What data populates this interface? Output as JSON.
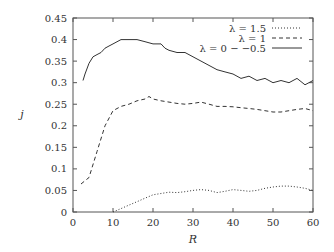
{
  "chart_data": {
    "type": "line",
    "title": "",
    "xlabel": "R",
    "ylabel": "j",
    "xlim": [
      0,
      60
    ],
    "ylim": [
      0,
      0.45
    ],
    "xticks": [
      "0",
      "10",
      "20",
      "30",
      "40",
      "50",
      "60"
    ],
    "yticks": [
      "0",
      "0.05",
      "0.1",
      "0.15",
      "0.2",
      "0.25",
      "0.3",
      "0.35",
      "0.4",
      "0.45"
    ],
    "grid": false,
    "legend_position": "top-right",
    "series": [
      {
        "name": "λ = 1.5",
        "style": "dotted",
        "x": [
          10,
          12,
          14,
          16,
          18,
          20,
          22,
          24,
          26,
          28,
          30,
          32,
          34,
          36,
          38,
          40,
          42,
          44,
          46,
          48,
          50,
          52,
          54,
          56,
          58,
          60
        ],
        "y": [
          0.0,
          0.008,
          0.016,
          0.024,
          0.032,
          0.04,
          0.043,
          0.046,
          0.045,
          0.047,
          0.05,
          0.052,
          0.05,
          0.045,
          0.048,
          0.052,
          0.05,
          0.048,
          0.05,
          0.055,
          0.058,
          0.06,
          0.06,
          0.058,
          0.055,
          0.05
        ]
      },
      {
        "name": "λ = 1",
        "style": "dashed",
        "x": [
          2,
          4,
          6,
          8,
          10,
          12,
          14,
          16,
          18,
          19,
          20,
          22,
          24,
          26,
          28,
          30,
          32,
          34,
          36,
          38,
          40,
          42,
          44,
          46,
          48,
          50,
          52,
          54,
          56,
          58,
          60
        ],
        "y": [
          0.065,
          0.08,
          0.14,
          0.2,
          0.235,
          0.245,
          0.25,
          0.258,
          0.262,
          0.268,
          0.262,
          0.258,
          0.255,
          0.252,
          0.25,
          0.252,
          0.255,
          0.25,
          0.245,
          0.245,
          0.244,
          0.242,
          0.24,
          0.238,
          0.235,
          0.232,
          0.232,
          0.235,
          0.238,
          0.24,
          0.235
        ]
      },
      {
        "name": "λ = 0 − −0.5",
        "style": "solid",
        "x": [
          2.5,
          3,
          4,
          5,
          6,
          7,
          8,
          9,
          10,
          12,
          14,
          16,
          18,
          20,
          21,
          22,
          23,
          24,
          26,
          28,
          30,
          32,
          34,
          36,
          38,
          40,
          42,
          44,
          46,
          48,
          50,
          52,
          54,
          56,
          58,
          60
        ],
        "y": [
          0.305,
          0.32,
          0.345,
          0.36,
          0.365,
          0.37,
          0.38,
          0.385,
          0.39,
          0.4,
          0.4,
          0.4,
          0.395,
          0.39,
          0.39,
          0.39,
          0.38,
          0.375,
          0.37,
          0.37,
          0.36,
          0.35,
          0.34,
          0.33,
          0.325,
          0.32,
          0.31,
          0.315,
          0.305,
          0.31,
          0.3,
          0.305,
          0.3,
          0.31,
          0.295,
          0.305
        ]
      }
    ]
  },
  "legend": {
    "items": [
      {
        "label": "λ = 1.5",
        "style": "dotted"
      },
      {
        "label": "λ = 1",
        "style": "dashed"
      },
      {
        "label": "λ = 0 − −0.5",
        "style": "solid"
      }
    ]
  },
  "axes": {
    "xlabel": "R",
    "ylabel": "j"
  },
  "colors": {
    "line": "#333333",
    "frame": "#555555"
  }
}
